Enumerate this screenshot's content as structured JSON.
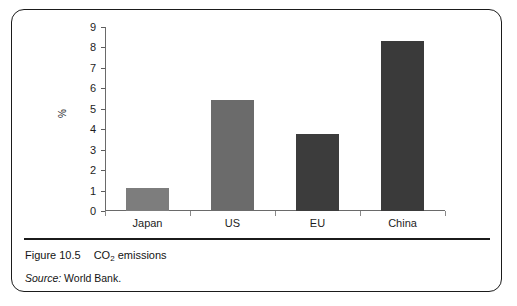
{
  "figure": {
    "number_label": "Figure 10.5",
    "title_prefix": "CO",
    "title_subscript": "2",
    "title_suffix": " emissions",
    "source_word": "Source:",
    "source_value": "World Bank."
  },
  "chart_data": {
    "type": "bar",
    "title": "CO2 emissions",
    "categories": [
      "Japan",
      "US",
      "EU",
      "China"
    ],
    "values": [
      1.15,
      5.45,
      3.75,
      8.3
    ],
    "xlabel": "",
    "ylabel": "%",
    "ylim": [
      0,
      9
    ],
    "ytick_labels": [
      "0",
      "1",
      "2",
      "3",
      "4",
      "5",
      "6",
      "7",
      "8",
      "9"
    ],
    "ytick_values": [
      0,
      1,
      2,
      3,
      4,
      5,
      6,
      7,
      8,
      9
    ],
    "grid": false,
    "legend": false,
    "bar_colors": [
      "#7d7d7d",
      "#6b6b6b",
      "#3c3c3c",
      "#3a3a3a"
    ],
    "axis_color": "#6a6a6a",
    "text_color": "#1d1d1d"
  }
}
